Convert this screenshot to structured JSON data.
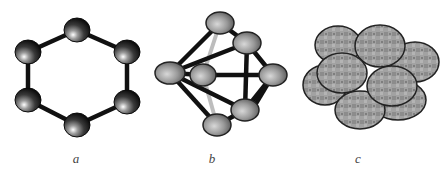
{
  "figure": {
    "panels": [
      {
        "id": "a",
        "label": "a",
        "description": "Six-atom ring (hexagon) with bonds"
      },
      {
        "id": "b",
        "label": "b",
        "description": "Seven-atom 3D cluster (bipyramid-like) with bonds"
      },
      {
        "id": "c",
        "label": "c",
        "description": "Close-packed cluster of overlapping spheres"
      }
    ],
    "colors": {
      "atom_dark": "#1a1a1a",
      "atom_gray": "#8a8a8a",
      "bond": "#111111",
      "sphere_fill": "#9c9c9c",
      "sphere_stroke": "#222222",
      "label": "#444444"
    }
  }
}
